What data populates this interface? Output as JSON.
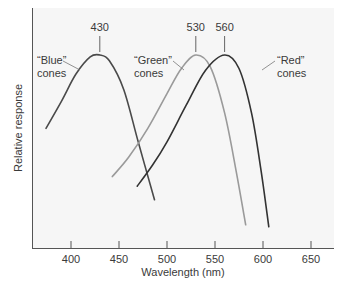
{
  "chart_data": {
    "type": "line",
    "title": "",
    "xlabel": "Wavelength (nm)",
    "ylabel": "Relative response",
    "xlim": [
      360,
      675
    ],
    "ylim": [
      0,
      1.1
    ],
    "x_ticks": [
      400,
      450,
      500,
      550,
      600,
      650
    ],
    "y_ticks": [],
    "grid": false,
    "legend": "inline labels",
    "series": [
      {
        "name": "“Blue” cones",
        "label_line1": "“Blue”",
        "label_line2": "cones",
        "peak": 430,
        "color": "#4a4a4a",
        "x": [
          374,
          390,
          405,
          420,
          430,
          440,
          455,
          470,
          487
        ],
        "y": [
          0.62,
          0.76,
          0.9,
          0.99,
          1.0,
          0.97,
          0.82,
          0.55,
          0.25
        ]
      },
      {
        "name": "“Green” cones",
        "label_line1": "“Green”",
        "label_line2": "cones",
        "peak": 530,
        "color": "#9a9a9a",
        "x": [
          443,
          460,
          480,
          500,
          515,
          530,
          545,
          560,
          572,
          582
        ],
        "y": [
          0.37,
          0.47,
          0.62,
          0.8,
          0.93,
          1.0,
          0.94,
          0.7,
          0.4,
          0.12
        ]
      },
      {
        "name": "“Red” cones",
        "label_line1": "“Red”",
        "label_line2": "cones",
        "peak": 560,
        "color": "#333333",
        "x": [
          469,
          485,
          500,
          520,
          540,
          560,
          575,
          588,
          598,
          606
        ],
        "y": [
          0.32,
          0.43,
          0.55,
          0.74,
          0.92,
          1.0,
          0.93,
          0.7,
          0.4,
          0.11
        ]
      }
    ],
    "annotations": [
      "430",
      "530",
      "560"
    ]
  },
  "figure_label": "3.30"
}
